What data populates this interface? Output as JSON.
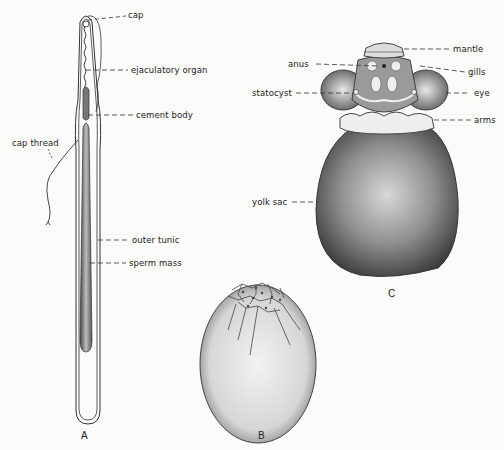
{
  "figure": {
    "panels": [
      {
        "id": "A",
        "caption": "A",
        "labels": {
          "cap": "cap",
          "ejaculatory_organ": "ejaculatory organ",
          "cement_body": "cement body",
          "cap_thread": "cap thread",
          "outer_tunic": "outer tunic",
          "sperm_mass": "sperm mass"
        }
      },
      {
        "id": "B",
        "caption": "B",
        "labels": {}
      },
      {
        "id": "C",
        "caption": "C",
        "labels": {
          "mantle": "mantle",
          "anus": "anus",
          "gills": "gills",
          "statocyst": "statocyst",
          "eye": "eye",
          "arms": "arms",
          "yolk_sac": "yolk sac"
        }
      }
    ]
  }
}
